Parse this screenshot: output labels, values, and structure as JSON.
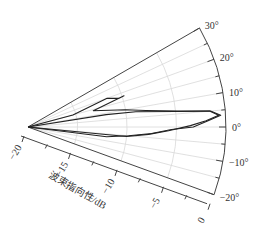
{
  "chart_data": {
    "type": "polar-line",
    "title": "",
    "angular_axis": {
      "range_deg": [
        -20,
        30
      ],
      "ticks": [
        -20,
        -10,
        0,
        10,
        20,
        30
      ],
      "tick_labels": [
        "−20°",
        "−10°",
        "0°",
        "10°",
        "20°",
        "30°"
      ],
      "grid_step_deg": 5
    },
    "radial_axis": {
      "label": "波束指向性/dB",
      "range": [
        -20,
        0
      ],
      "ticks": [
        -20,
        -15,
        -10,
        -5,
        0
      ],
      "tick_labels": [
        "−20",
        "−15",
        "−10",
        "−5",
        "0"
      ],
      "minor_step": 2.5
    },
    "grid": true,
    "series": [
      {
        "name": "outer",
        "points_deg_db": [
          [
            12,
            -20
          ],
          [
            15,
            -15.3
          ],
          [
            20,
            -11.5
          ],
          [
            17.5,
            -10.4
          ],
          [
            18,
            -9.8
          ],
          [
            14,
            -13.2
          ],
          [
            10,
            -10
          ],
          [
            8,
            -8
          ],
          [
            6,
            -4.5
          ],
          [
            5,
            -1.5
          ],
          [
            3.5,
            -0.5
          ],
          [
            2,
            -1.8
          ],
          [
            0,
            -3.3
          ],
          [
            -1,
            -5.5
          ],
          [
            -3,
            -7.5
          ],
          [
            -5,
            -9.8
          ],
          [
            -7,
            -12
          ],
          [
            -10,
            -20
          ]
        ]
      },
      {
        "name": "inner",
        "points_deg_db": [
          [
            8,
            -20
          ],
          [
            9,
            -12
          ],
          [
            8,
            -9
          ],
          [
            6,
            -5
          ],
          [
            5,
            -1.6
          ],
          [
            3.5,
            -0.7
          ],
          [
            2,
            -2
          ],
          [
            0.5,
            -3.6
          ],
          [
            -1.5,
            -5.8
          ],
          [
            -3.5,
            -7.8
          ],
          [
            -5.5,
            -10
          ],
          [
            -8,
            -20
          ]
        ]
      }
    ]
  }
}
